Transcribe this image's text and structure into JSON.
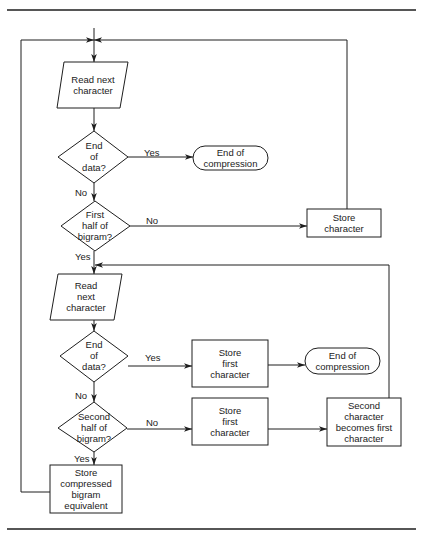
{
  "diagram": {
    "type": "flowchart",
    "page_header": "...igram encoding...",
    "nodes": [
      {
        "id": "read1",
        "shape": "parallelogram",
        "label": "Read next\ncharacter"
      },
      {
        "id": "end_data1",
        "shape": "diamond",
        "label": "End\nof\ndata?"
      },
      {
        "id": "end_comp1",
        "shape": "terminator",
        "label": "End of\ncompression"
      },
      {
        "id": "first_half",
        "shape": "diamond",
        "label": "First\nhalf of\nbigram?"
      },
      {
        "id": "store_char",
        "shape": "process",
        "label": "Store\ncharacter"
      },
      {
        "id": "read2",
        "shape": "parallelogram",
        "label": "Read\nnext\ncharacter"
      },
      {
        "id": "end_data2",
        "shape": "diamond",
        "label": "End\nof\ndata?"
      },
      {
        "id": "store_first1",
        "shape": "process",
        "label": "Store\nfirst\ncharacter"
      },
      {
        "id": "end_comp2",
        "shape": "terminator",
        "label": "End of\ncompression"
      },
      {
        "id": "second_half",
        "shape": "diamond",
        "label": "Second\nhalf of\nbigram?"
      },
      {
        "id": "store_first2",
        "shape": "process",
        "label": "Store\nfirst\ncharacter"
      },
      {
        "id": "second_becomes_first",
        "shape": "process",
        "label": "Second\ncharacter\nbecomes first\ncharacter"
      },
      {
        "id": "store_compressed",
        "shape": "process",
        "label": "Store\ncompressed\nbigram\nequivalent"
      }
    ],
    "edges": [
      {
        "from": "read1",
        "to": "end_data1",
        "label": ""
      },
      {
        "from": "end_data1",
        "to": "end_comp1",
        "label": "Yes"
      },
      {
        "from": "end_data1",
        "to": "first_half",
        "label": "No"
      },
      {
        "from": "first_half",
        "to": "store_char",
        "label": "No"
      },
      {
        "from": "store_char",
        "to": "read1",
        "label": ""
      },
      {
        "from": "first_half",
        "to": "read2",
        "label": "Yes"
      },
      {
        "from": "read2",
        "to": "end_data2",
        "label": ""
      },
      {
        "from": "end_data2",
        "to": "store_first1",
        "label": "Yes"
      },
      {
        "from": "store_first1",
        "to": "end_comp2",
        "label": ""
      },
      {
        "from": "end_data2",
        "to": "second_half",
        "label": "No"
      },
      {
        "from": "second_half",
        "to": "store_first2",
        "label": "No"
      },
      {
        "from": "store_first2",
        "to": "second_becomes_first",
        "label": ""
      },
      {
        "from": "second_becomes_first",
        "to": "read2",
        "label": ""
      },
      {
        "from": "second_half",
        "to": "store_compressed",
        "label": "Yes"
      },
      {
        "from": "store_compressed",
        "to": "read1",
        "label": ""
      }
    ],
    "edge_labels": {
      "yes": "Yes",
      "no": "No"
    },
    "colors": {
      "stroke": "#1e1e1e",
      "background": "#ffffff"
    }
  }
}
